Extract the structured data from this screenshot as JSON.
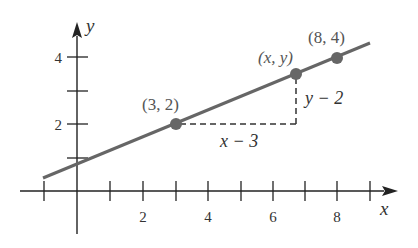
{
  "figure": {
    "axes": {
      "x_label": "x",
      "y_label": "y",
      "x_tick_labels": [
        "2",
        "4",
        "6",
        "8"
      ],
      "y_tick_labels": [
        "2",
        "4"
      ]
    },
    "points": [
      {
        "label": "(3, 2)",
        "x": 3,
        "y": 2
      },
      {
        "label": "(x, y)",
        "x": 6.7,
        "y": 3.5
      },
      {
        "label": "(8, 4)",
        "x": 8,
        "y": 4
      }
    ],
    "annotations": {
      "horizontal_run": "x − 3",
      "vertical_rise": "y − 2"
    },
    "colors": {
      "line": "#666666",
      "points": "#666666",
      "axes": "#222222"
    }
  }
}
